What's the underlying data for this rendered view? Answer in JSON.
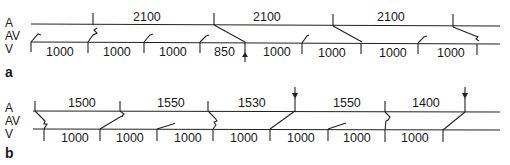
{
  "figure": {
    "type": "ladder diagram",
    "row_labels": [
      "A",
      "AV",
      "V"
    ],
    "panels": [
      {
        "label": "a",
        "atrial_intervals": [
          "2100",
          "2100",
          "2100"
        ],
        "ventricular_intervals": [
          "1000",
          "1000",
          "1000",
          "850",
          "1000",
          "1000",
          "1000",
          "1000"
        ],
        "markers": [
          "arrow below V at 850 interval end"
        ]
      },
      {
        "label": "b",
        "atrial_intervals": [
          "1500",
          "1550",
          "1530",
          "1550",
          "1400"
        ],
        "ventricular_intervals": [
          "1000",
          "1000",
          "1000",
          "1000",
          "1000",
          "1000",
          "1000"
        ],
        "markers": [
          "arrow above A after 1530",
          "arrow above A after 1400"
        ]
      }
    ]
  },
  "panel_a": {
    "label": "a",
    "rows": {
      "a": "A",
      "av": "AV",
      "v": "V"
    },
    "atrial": [
      "2100",
      "2100",
      "2100"
    ],
    "ventricular": [
      "1000",
      "1000",
      "1000",
      "850",
      "1000",
      "1000",
      "1000",
      "1000"
    ]
  },
  "panel_b": {
    "label": "b",
    "rows": {
      "a": "A",
      "av": "AV",
      "v": "V"
    },
    "atrial": [
      "1500",
      "1550",
      "1530",
      "1550",
      "1400"
    ],
    "ventricular": [
      "1000",
      "1000",
      "1000",
      "1000",
      "1000",
      "1000",
      "1000"
    ]
  },
  "colors": {
    "ink": "#222222",
    "background": "#ffffff"
  }
}
